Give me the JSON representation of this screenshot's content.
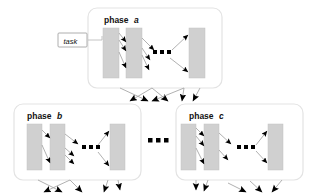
{
  "diagram": {
    "colors": {
      "column_fill": "#d0d0d0",
      "column_stroke": "#b8b8b8",
      "phase_box_stroke": "#e2e2e2",
      "connector_stroke": "#a8a8a8",
      "arrowhead_fill": "#000000",
      "text": "#111111",
      "background": "#ffffff",
      "task_box_fill": "#ffffff",
      "task_box_stroke": "#9a9a9a"
    },
    "annotation": {
      "task_label": "task"
    },
    "ellipsis_glyph": "...",
    "phases": [
      {
        "id": "phase-a",
        "label_prefix": "phase",
        "label_letter": "a",
        "box": {
          "x": 88,
          "y": 8,
          "w": 134,
          "h": 80
        },
        "label_pos": {
          "x": 104,
          "y": 22
        },
        "columns": [
          {
            "id": "a-col-1",
            "x": 103,
            "y": 28,
            "w": 16,
            "h": 50
          },
          {
            "id": "a-col-2",
            "x": 126,
            "y": 28,
            "w": 16,
            "h": 50
          },
          {
            "id": "a-col-last",
            "x": 189,
            "y": 28,
            "w": 16,
            "h": 50
          }
        ],
        "inner_ellipsis": {
          "x": 158,
          "y": 53
        },
        "inner_arrows": 6
      },
      {
        "id": "phase-b",
        "label_prefix": "phase",
        "label_letter": "b",
        "box": {
          "x": 14,
          "y": 104,
          "w": 127,
          "h": 76
        },
        "label_pos": {
          "x": 27,
          "y": 118
        },
        "columns": [
          {
            "id": "b-col-1",
            "x": 27,
            "y": 124,
            "w": 15,
            "h": 46
          },
          {
            "id": "b-col-2",
            "x": 50,
            "y": 124,
            "w": 15,
            "h": 46
          },
          {
            "id": "b-col-last",
            "x": 110,
            "y": 124,
            "w": 15,
            "h": 46
          }
        ],
        "inner_ellipsis": {
          "x": 88,
          "y": 147
        },
        "inner_arrows": 6
      },
      {
        "id": "phase-c",
        "label_prefix": "phase",
        "label_letter": "c",
        "box": {
          "x": 176,
          "y": 104,
          "w": 127,
          "h": 76
        },
        "label_pos": {
          "x": 189,
          "y": 118
        },
        "columns": [
          {
            "id": "c-col-1",
            "x": 181,
            "y": 124,
            "w": 15,
            "h": 46
          },
          {
            "id": "c-col-2",
            "x": 204,
            "y": 124,
            "w": 15,
            "h": 46
          },
          {
            "id": "c-col-last",
            "x": 268,
            "y": 124,
            "w": 15,
            "h": 46
          }
        ],
        "inner_ellipsis": {
          "x": 243,
          "y": 147
        },
        "inner_arrows": 6
      }
    ],
    "between_phases_ellipsis": {
      "x": 157,
      "y": 140
    },
    "inter_phase_arrow_groups": [
      {
        "id": "arrows-below-phase-a",
        "count": 6
      },
      {
        "id": "arrows-below-phase-b",
        "count": 5
      },
      {
        "id": "arrows-below-phase-c",
        "count": 5
      }
    ]
  }
}
